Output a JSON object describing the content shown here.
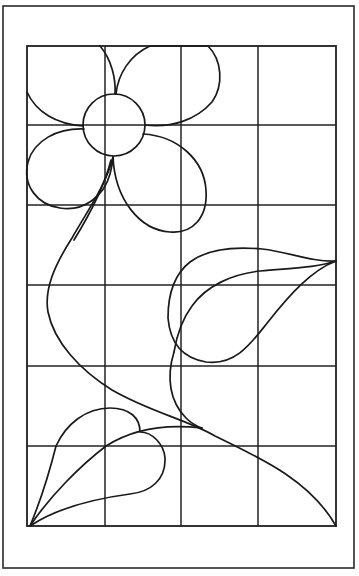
{
  "figure": {
    "stroke_color": "#1a1a1a",
    "background_color": "#ffffff",
    "outer_frame": {
      "x": 3,
      "y": 6,
      "width": 351,
      "height": 562
    },
    "grid": {
      "columns": 4,
      "rows": 6,
      "x_lines": [
        27,
        105,
        181,
        258,
        336
      ],
      "y_lines": [
        46,
        125,
        205,
        285,
        366,
        446,
        526
      ]
    },
    "elements": [
      {
        "name": "flower-center",
        "shape": "circle",
        "cx": 114,
        "cy": 125,
        "r": 31
      },
      {
        "name": "petal-top-left",
        "shape": "path"
      },
      {
        "name": "petal-top-right",
        "shape": "path"
      },
      {
        "name": "petal-bottom-left",
        "shape": "path"
      },
      {
        "name": "petal-bottom-right",
        "shape": "path"
      },
      {
        "name": "main-stem",
        "shape": "path"
      },
      {
        "name": "right-leaf",
        "shape": "path"
      },
      {
        "name": "right-leaf-stem",
        "shape": "path"
      },
      {
        "name": "bottom-left-leaf",
        "shape": "path"
      }
    ]
  }
}
